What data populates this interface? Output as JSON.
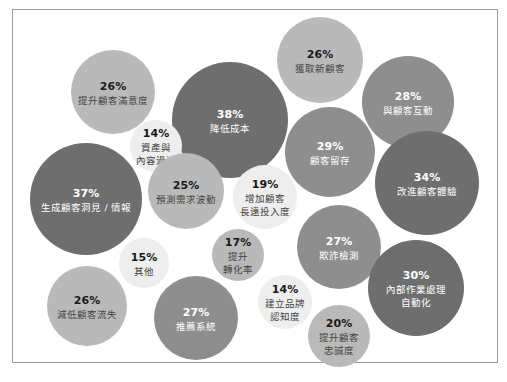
{
  "chart_data": {
    "type": "bubble",
    "title": "",
    "shade_colors": {
      "dark": "#6e6e6e",
      "medium": "#8e8e8e",
      "light": "#b9b9b9",
      "pale": "#eeeeee"
    },
    "text_colors": {
      "on_dark": "#ffffff",
      "on_light": "#1a1a1a",
      "label_on_light": "#444444"
    },
    "bubbles": [
      {
        "value": 26,
        "pct_label": "26%",
        "label": [
          "提升顧客滿意度"
        ],
        "shade": "light"
      },
      {
        "value": 38,
        "pct_label": "38%",
        "label": [
          "降低成本"
        ],
        "shade": "dark"
      },
      {
        "value": 26,
        "pct_label": "26%",
        "label": [
          "獲取新顧客"
        ],
        "shade": "light"
      },
      {
        "value": 28,
        "pct_label": "28%",
        "label": [
          "與顧客互動"
        ],
        "shade": "medium"
      },
      {
        "value": 14,
        "pct_label": "14%",
        "label": [
          "資產與",
          "內容過濾"
        ],
        "shade": "pale"
      },
      {
        "value": 29,
        "pct_label": "29%",
        "label": [
          "顧客留存"
        ],
        "shade": "medium"
      },
      {
        "value": 34,
        "pct_label": "34%",
        "label": [
          "改進顧客體驗"
        ],
        "shade": "dark"
      },
      {
        "value": 37,
        "pct_label": "37%",
        "label": [
          "生成顧客洞見 / 情報"
        ],
        "shade": "dark"
      },
      {
        "value": 25,
        "pct_label": "25%",
        "label": [
          "預測需求波動"
        ],
        "shade": "light"
      },
      {
        "value": 19,
        "pct_label": "19%",
        "label": [
          "增加顧客",
          "長遠投入度"
        ],
        "shade": "pale"
      },
      {
        "value": 27,
        "pct_label": "27%",
        "label": [
          "欺詐檢測"
        ],
        "shade": "medium"
      },
      {
        "value": 15,
        "pct_label": "15%",
        "label": [
          "其他"
        ],
        "shade": "pale"
      },
      {
        "value": 17,
        "pct_label": "17%",
        "label": [
          "提升",
          "轉化率"
        ],
        "shade": "light"
      },
      {
        "value": 30,
        "pct_label": "30%",
        "label": [
          "內部作業處理",
          "自動化"
        ],
        "shade": "dark"
      },
      {
        "value": 14,
        "pct_label": "14%",
        "label": [
          "建立品牌",
          "認知度"
        ],
        "shade": "pale"
      },
      {
        "value": 20,
        "pct_label": "20%",
        "label": [
          "提升顧客",
          "忠誠度"
        ],
        "shade": "light"
      },
      {
        "value": 26,
        "pct_label": "26%",
        "label": [
          "減低顧客流失"
        ],
        "shade": "light"
      },
      {
        "value": 27,
        "pct_label": "27%",
        "label": [
          "推薦系統"
        ],
        "shade": "medium"
      }
    ]
  }
}
